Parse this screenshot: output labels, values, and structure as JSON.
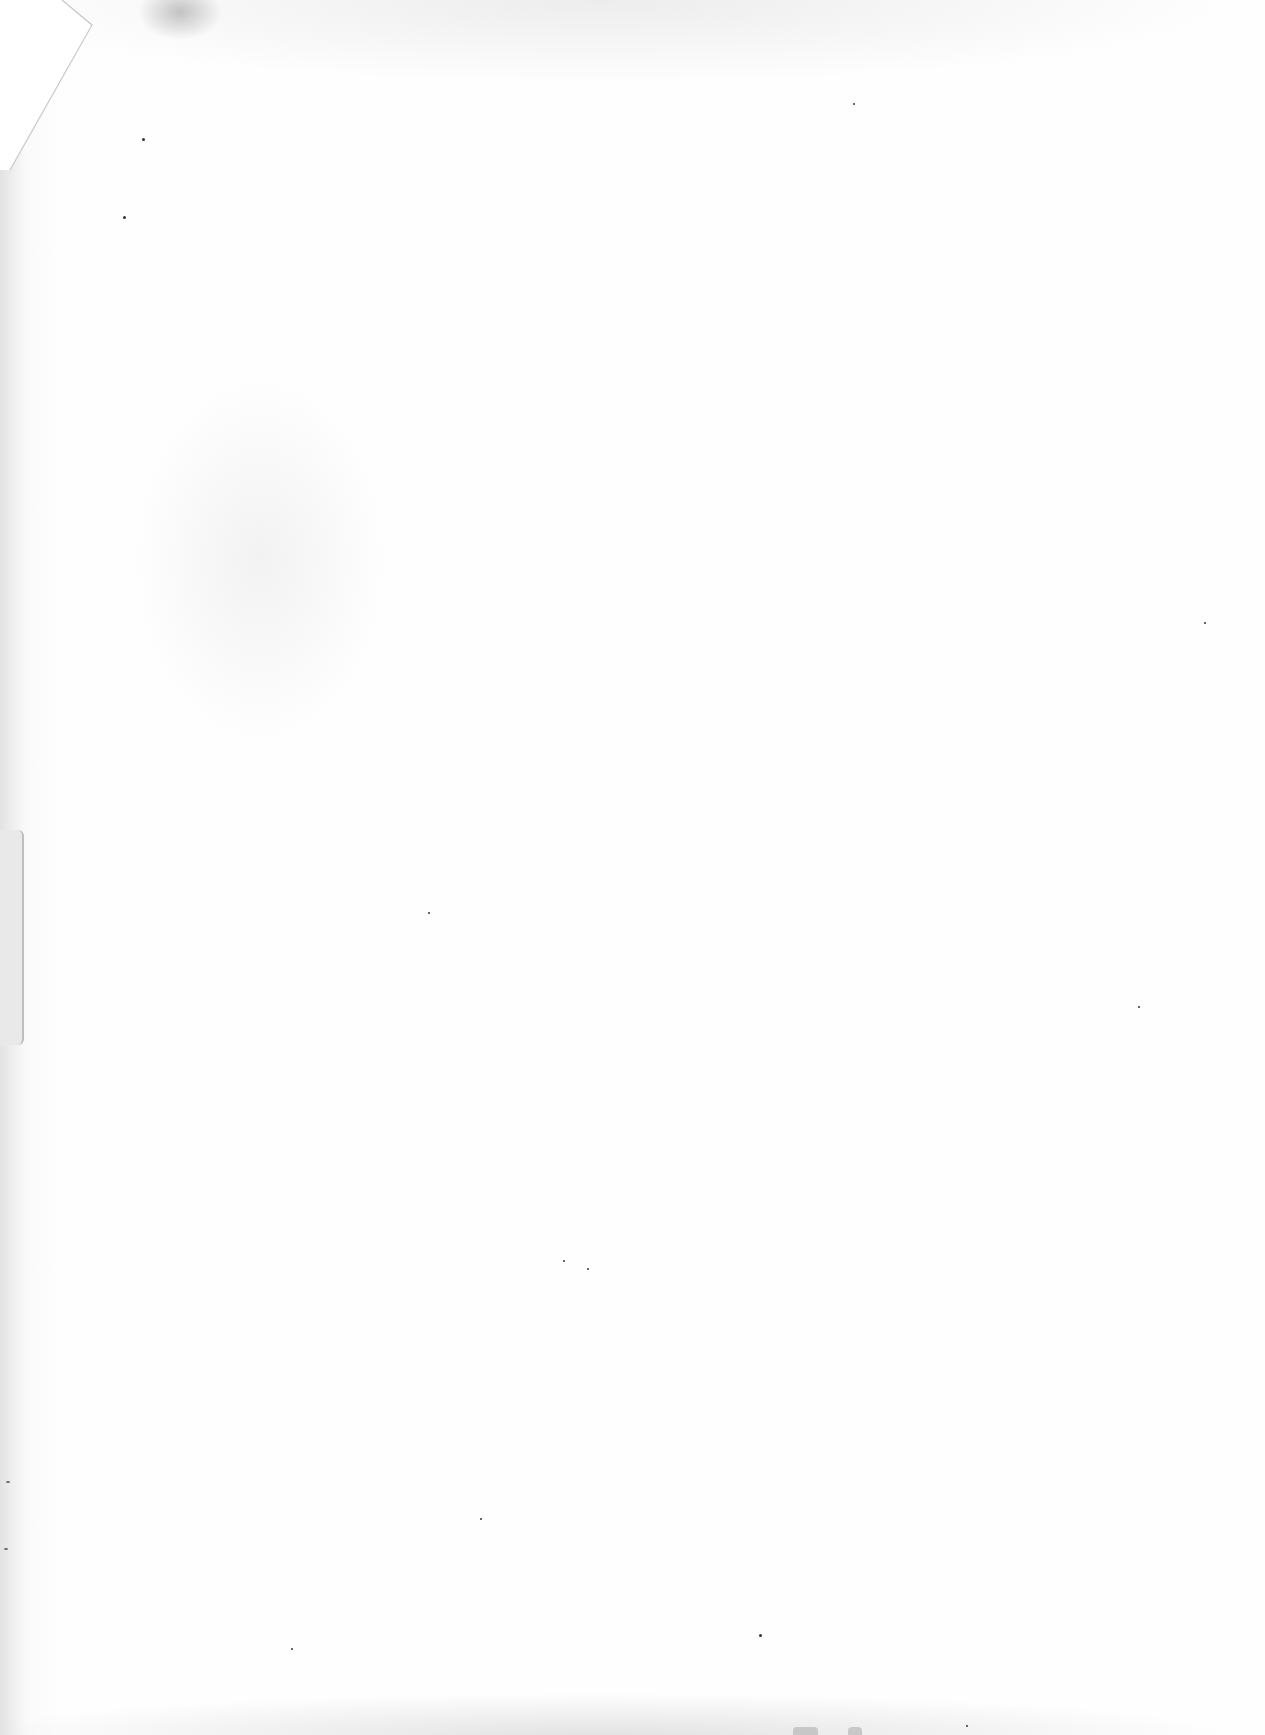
{
  "document": {
    "type": "blank scanned page",
    "text_content": "",
    "background_color": "#fefefe"
  },
  "artifacts": {
    "corner_fold": {
      "position": "top-left",
      "color": "#ffffff",
      "edge_color": "#c8c8c8"
    },
    "top_smudge": {
      "position": "top",
      "color": "#969696"
    },
    "edge_tab": {
      "position": "left",
      "color": "#e9e9e9"
    },
    "specks_count": 14
  }
}
